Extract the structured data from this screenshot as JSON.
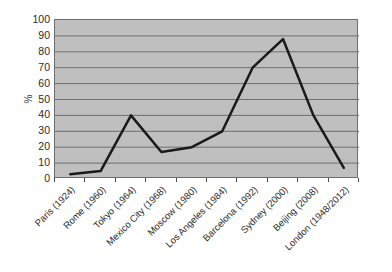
{
  "chart_data": {
    "type": "line",
    "title": "",
    "subtitle": "",
    "xlabel": "",
    "ylabel": "%",
    "ylim": [
      0,
      100
    ],
    "ytick_step": 10,
    "yticks": [
      100,
      90,
      80,
      70,
      60,
      50,
      40,
      30,
      20,
      10,
      0
    ],
    "grid": "horizontal",
    "legend": "none",
    "plot_background": "#bfbfbf",
    "line_color": "#1a1a1a",
    "line_width": 2.5,
    "markers": "none",
    "categories": [
      "Paris (1924)",
      "Rome (1960)",
      "Tokyo (1964)",
      "Mexico City (1968)",
      "Moscow (1980)",
      "Los Angeles (1984)",
      "Barcelona (1992)",
      "Sydney (2000)",
      "Beijing (2008)",
      "London (1948/2012)"
    ],
    "values": [
      3,
      5,
      40,
      17,
      20,
      30,
      70,
      88,
      40,
      7
    ]
  }
}
